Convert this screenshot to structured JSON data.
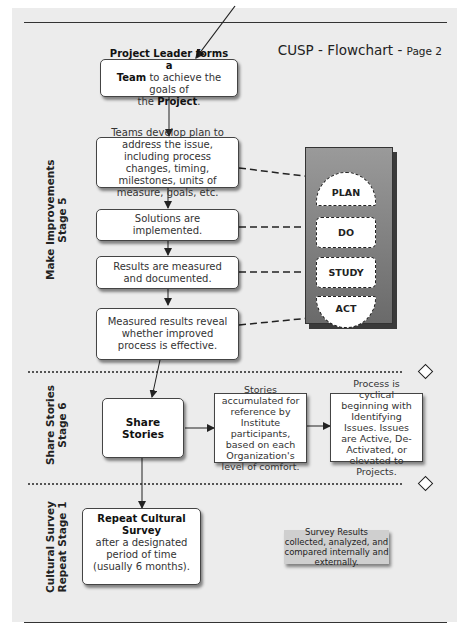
{
  "header": {
    "title": "CUSP - Flowchart - ",
    "page": "Page 2"
  },
  "stages": [
    {
      "line1": "Make Improvements",
      "line2": "Stage 5"
    },
    {
      "line1": "Share Stories",
      "line2": "Stage 6"
    },
    {
      "line1": "Cultural Survey",
      "line2": "Repeat Stage 1"
    }
  ],
  "boxes": {
    "project_leader": {
      "bold1": "Project Leader forms a",
      "bold2": "Team",
      "text2": " to achieve the goals of",
      "text3": "the ",
      "bold3": "Project",
      "end": "."
    },
    "teams_develop": "Teams develop plan to address the issue, including process changes, timing, milestones, units of measure, goals, etc.",
    "solutions": "Solutions are implemented.",
    "results": "Results are measured and documented.",
    "measured": "Measured results reveal whether improved process is effective.",
    "share_stories": "Share Stories",
    "stories_accumulated": "Stories accumulated for reference by Institute participants, based on each Organization's level of comfort.",
    "process_cyclical": "Process is cyclical beginning with Identifying Issues. Issues are Active, De-Activated, or elevated to Projects.",
    "repeat_survey_bold": "Repeat Cultural Survey",
    "repeat_survey_text": "after a designated period of time (usually 6 months).",
    "survey_note": "Survey Results collected, analyzed, and compared internally and externally."
  },
  "pdca": {
    "plan": "PLAN",
    "do": "DO",
    "study": "STUDY",
    "act": "ACT"
  },
  "colors": {
    "page_bg": "#ececec",
    "pdca_panel": "#808080",
    "note_bg": "#cfcfcf"
  }
}
